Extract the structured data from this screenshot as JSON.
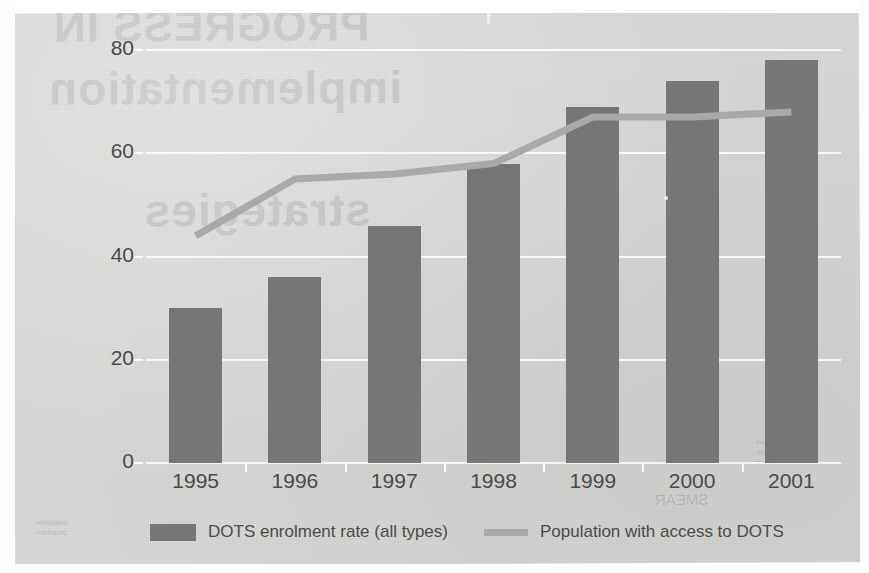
{
  "chart_data": {
    "type": "bar",
    "title": "",
    "xlabel": "",
    "ylabel": "",
    "ylim": [
      0,
      80
    ],
    "ytick_values": [
      0,
      20,
      40,
      60,
      80
    ],
    "ytick_labels": [
      "0",
      "20",
      "40",
      "60",
      "80"
    ],
    "grid": true,
    "legend_position": "bottom",
    "categories": [
      "1995",
      "1996",
      "1997",
      "1998",
      "1999",
      "2000",
      "2001"
    ],
    "series": [
      {
        "name": "DOTS enrolment rate (all types)",
        "type": "bar",
        "color": "#757675",
        "values": [
          30,
          36,
          46,
          58,
          69,
          74,
          78
        ]
      },
      {
        "name": "Population with access to DOTS",
        "type": "line",
        "color": "#a8aaa8",
        "values": [
          44,
          55,
          56,
          58,
          67,
          67,
          68
        ]
      }
    ]
  },
  "axes": {
    "y_ticks": [
      {
        "label": "80",
        "value": 80
      },
      {
        "label": "60",
        "value": 60
      },
      {
        "label": "40",
        "value": 40
      },
      {
        "label": "20",
        "value": 20
      },
      {
        "label": "0",
        "value": 0
      }
    ],
    "x_ticks": [
      "1995",
      "1996",
      "1997",
      "1998",
      "1999",
      "2000",
      "2001"
    ]
  },
  "legend": {
    "bar_label": "DOTS enrolment rate (all types)",
    "line_label": "Population with access to DOTS"
  },
  "ghost_text": {
    "line1": "PROGRESS IN",
    "line2": "implementation",
    "line3": "strategies",
    "small1": "reported",
    "small2": "estimate",
    "small3": "notified",
    "small4": "population",
    "small5": "proportion",
    "small6": "SMEAR"
  },
  "colors": {
    "page_background": "#d5d6d4",
    "bar": "#757675",
    "line": "#a8aaa8",
    "gridline": "#fafaf8",
    "text": "#4a4b4a"
  }
}
